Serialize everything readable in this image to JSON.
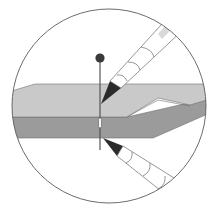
{
  "figure": {
    "title": "Marking both fabric layers with a pin and pencils",
    "colors": {
      "background": "#ffffff",
      "circle_outline": "#5a5a5a",
      "top_layer": "#c9c9c9",
      "bottom_layer": "#9b9b9b",
      "layer_outline": "#6e6e6e",
      "pin_head": "#3a3a3a",
      "pin_shaft": "#555555",
      "pencil_lead": "#2b2b2b",
      "pencil_body": "#ffffff",
      "pencil_outline": "#6a6a6a",
      "pencil_highlight": "#d9d9d9"
    },
    "elements": [
      {
        "name": "top-fabric-layer",
        "label": "Top fabric layer"
      },
      {
        "name": "bottom-fabric-layer",
        "label": "Bottom fabric layer"
      },
      {
        "name": "pin",
        "label": "Pin"
      },
      {
        "name": "upper-pencil",
        "label": "Pencil marking top layer"
      },
      {
        "name": "lower-pencil",
        "label": "Pencil marking bottom layer"
      }
    ]
  }
}
